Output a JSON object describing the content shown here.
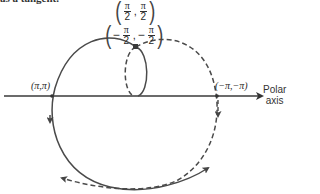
{
  "caption_fragment": "as a tangent.",
  "points": {
    "top": {
      "label": "(π/2, π/2)",
      "x": {
        "num": "π",
        "den": "2",
        "sign": ""
      },
      "y": {
        "num": "π",
        "den": "2",
        "sign": ""
      }
    },
    "loop_top": {
      "label": "(−π/2, −π/2)",
      "x": {
        "num": "π",
        "den": "2",
        "sign": "−"
      },
      "y": {
        "num": "π",
        "den": "2",
        "sign": "−"
      }
    },
    "left_crossing": {
      "label": "(π,π)"
    },
    "right_crossing": {
      "label": "(−π,−π)"
    }
  },
  "axis": {
    "label_line1": "Polar",
    "label_line2": "axis"
  },
  "colors": {
    "curve": "#4a4a4a",
    "axis": "#3a3a3a",
    "background": "#ffffff"
  },
  "legend": {
    "solid": "curve for θ ≥ 0 (r = θ)",
    "dashed": "curve for θ ≤ 0"
  }
}
